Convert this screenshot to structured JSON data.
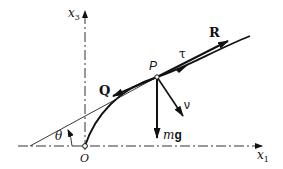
{
  "diagram": {
    "type": "force-diagram",
    "axes": {
      "horizontal": {
        "label": "x",
        "subscript": "1"
      },
      "vertical": {
        "label": "x",
        "subscript": "3"
      }
    },
    "origin_label": "O",
    "point_label": "P",
    "angle_label": "θ",
    "vectors": [
      {
        "name": "R",
        "label": "R",
        "bold": true,
        "direction": "along tangent, forward"
      },
      {
        "name": "tau",
        "label": "τ",
        "bold": false,
        "direction": "unit tangent"
      },
      {
        "name": "Q",
        "label": "Q",
        "bold": true,
        "direction": "along tangent, backward"
      },
      {
        "name": "mg",
        "label_italic": "m",
        "label_bold": "g",
        "direction": "vertical down"
      },
      {
        "name": "nu",
        "label": "ν",
        "bold": false,
        "direction": "unit normal"
      }
    ],
    "colors": {
      "ink": "#111111",
      "background": "#ffffff"
    }
  }
}
